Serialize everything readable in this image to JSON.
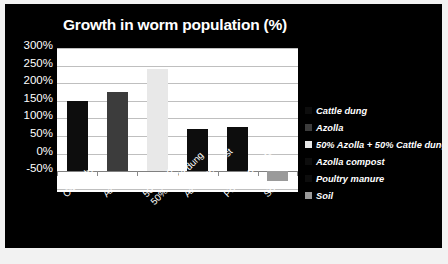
{
  "panel": {
    "background_color": "#000000",
    "text_color": "#ffffff"
  },
  "chart_data": {
    "type": "bar",
    "title": "Growth in worm population (%)",
    "xlabel": "",
    "ylabel": "",
    "ylim": [
      -50,
      300
    ],
    "ytick_labels": [
      "300%",
      "250%",
      "200%",
      "150%",
      "100%",
      "50%",
      "0%",
      "-50%"
    ],
    "ytick_values": [
      300,
      250,
      200,
      150,
      100,
      50,
      0,
      -50
    ],
    "grid": true,
    "legend_position": "right",
    "categories": [
      "Cattle dung",
      "Azolla",
      "50% Azolla + 50% Cattle dung",
      "Azolla compost",
      "Poultry manure",
      "Soil"
    ],
    "category_labels": [
      {
        "line1": "Cattle dung",
        "line2": ""
      },
      {
        "line1": "Azolla",
        "line2": ""
      },
      {
        "line1": "50% Azolla +",
        "line2": "50% Cattle dung"
      },
      {
        "line1": "Azolla compost",
        "line2": ""
      },
      {
        "line1": "Poultry manure",
        "line2": ""
      },
      {
        "line1": "Soil",
        "line2": ""
      }
    ],
    "values": [
      170,
      193,
      250,
      102,
      107,
      -23
    ],
    "bar_colors": [
      "#0d0d0d",
      "#3c3c3c",
      "#e8e8e8",
      "#0d0d0d",
      "#0d0d0d",
      "#9a9a9a"
    ],
    "legend": [
      {
        "label": "Cattle dung",
        "color": "#0d0d0d"
      },
      {
        "label": "Azolla",
        "color": "#3c3c3c"
      },
      {
        "label": "50% Azolla + 50% Cattle dung",
        "color": "#e8e8e8"
      },
      {
        "label": "Azolla compost",
        "color": "#0d0d0d"
      },
      {
        "label": "Poultry manure",
        "color": "#0d0d0d"
      },
      {
        "label": "Soil",
        "color": "#9a9a9a"
      }
    ]
  }
}
